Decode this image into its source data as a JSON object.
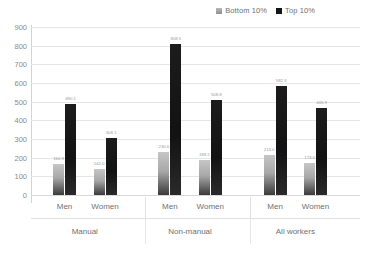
{
  "chart_data": {
    "type": "bar",
    "title": "",
    "xlabel": "",
    "ylabel": "",
    "ylim": [
      0,
      900
    ],
    "ytick_step": 100,
    "yticks": [
      900,
      800,
      700,
      600,
      500,
      400,
      300,
      200,
      100,
      0
    ],
    "grid": true,
    "legend_position": "top-right",
    "groups": [
      "Manual",
      "Non-manual",
      "All workers"
    ],
    "subcategories": [
      "Men",
      "Women"
    ],
    "categories": [
      "Manual - Men",
      "Manual - Women",
      "Non-manual - Men",
      "Non-manual - Women",
      "All workers - Men",
      "All workers - Women"
    ],
    "series": [
      {
        "name": "Bottom 10%",
        "color": "#a8a8a8",
        "values": [
          166.9,
          142.0,
          230.6,
          189.2,
          213.0,
          173.0
        ],
        "labels": [
          "166.9",
          "142.0",
          "230.6",
          "189.2",
          "213.0",
          "173.0"
        ]
      },
      {
        "name": "Top 10%",
        "color": "#151515",
        "values": [
          490.1,
          308.1,
          808.5,
          508.8,
          582.3,
          465.9
        ],
        "labels": [
          "490.1",
          "308.1",
          "808.5",
          "508.8",
          "582.3",
          "465.9"
        ]
      }
    ]
  },
  "legend": {
    "entries": [
      {
        "label": "Bottom 10%"
      },
      {
        "label": "Top 10%"
      }
    ]
  },
  "axis": {
    "groups": [
      {
        "label": "Manual"
      },
      {
        "label": "Non-manual"
      },
      {
        "label": "All workers"
      }
    ],
    "subcategories": [
      {
        "label": "Men"
      },
      {
        "label": "Women"
      },
      {
        "label": "Men"
      },
      {
        "label": "Women"
      },
      {
        "label": "Men"
      },
      {
        "label": "Women"
      }
    ]
  }
}
